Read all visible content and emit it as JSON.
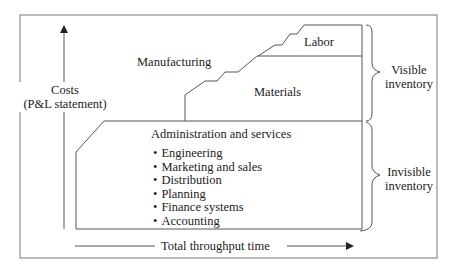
{
  "diagram": {
    "title": "",
    "y_axis": {
      "label_line1": "Costs",
      "label_line2": "(P&L statement)"
    },
    "x_axis": {
      "label": "Total throughput time"
    },
    "regions": {
      "manufacturing": "Manufacturing",
      "labor": "Labor",
      "materials": "Materials",
      "admin": "Administration and services"
    },
    "admin_items": [
      "Engineering",
      "Marketing and sales",
      "Distribution",
      "Planning",
      "Finance systems",
      "Accounting"
    ],
    "braces": {
      "visible": {
        "line1": "Visible",
        "line2": "inventory"
      },
      "invisible": {
        "line1": "Invisible",
        "line2": "inventory"
      }
    },
    "colors": {
      "line": "#555555",
      "text": "#222222",
      "background": "#ffffff"
    }
  }
}
